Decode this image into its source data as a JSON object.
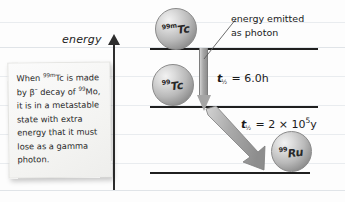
{
  "diagram": {
    "axis": {
      "label": "energy",
      "direction": "up"
    },
    "levels": [
      {
        "name": "upper-level",
        "nuclide": "99mTc"
      },
      {
        "name": "middle-level",
        "nuclide": "99Tc"
      },
      {
        "name": "lower-level",
        "nuclide": "99Ru"
      }
    ],
    "spheres": [
      {
        "mass": "99m",
        "symbol": "Tc",
        "full": "99mTc"
      },
      {
        "mass": "99",
        "symbol": "Tc",
        "full": "99Tc"
      },
      {
        "mass": "99",
        "symbol": "Ru",
        "full": "99Ru"
      }
    ],
    "callout": {
      "line1": "energy emitted",
      "line2": "as photon"
    },
    "halflives": [
      {
        "variable": "t",
        "subscript": "½",
        "equals": "=",
        "value": "6.0",
        "unit": "h",
        "full": "t½ = 6.0 h"
      },
      {
        "variable": "t",
        "subscript": "½",
        "equals": "=",
        "value": "2 × 10",
        "exponent": "5",
        "unit": "y",
        "full": "t½ = 2 × 10⁵ y"
      }
    ]
  },
  "sticky_note": {
    "segments": [
      {
        "type": "text",
        "value": "When "
      },
      {
        "type": "sup",
        "value": "99m"
      },
      {
        "type": "text",
        "value": "Tc is made by β"
      },
      {
        "type": "sup",
        "value": "–"
      },
      {
        "type": "text",
        "value": " decay of "
      },
      {
        "type": "sup",
        "value": "99"
      },
      {
        "type": "text",
        "value": "Mo, it is in a metastable state with extra energy that it must lose as a gamma photon."
      }
    ],
    "plain_text": "When 99mTc is made by β– decay of 99Mo, it is in a metastable state with extra energy that it must lose as a gamma photon."
  },
  "colors": {
    "background": "#fdfdfd",
    "rule_line": "#e9ecef",
    "axis": "#2e2e2e",
    "level_line": "#1f1f1f",
    "arrow_fill": "#a5a5a5",
    "arrow_stroke": "#7d7d7d",
    "sphere_light": "#f2f2f2",
    "sphere_dark": "#6e6e6e",
    "text": "#1b1b1b",
    "note_bg": "#f4f4f2"
  }
}
